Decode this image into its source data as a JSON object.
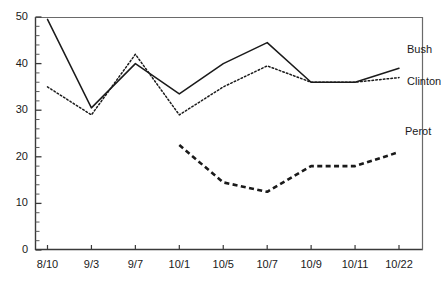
{
  "chart_data": {
    "type": "line",
    "title": "",
    "subtitle": "",
    "xlabel": "",
    "ylabel": "",
    "categories": [
      "8/10",
      "9/3",
      "9/7",
      "10/1",
      "10/5",
      "10/7",
      "10/9",
      "10/11",
      "10/22"
    ],
    "ylim": [
      0,
      50
    ],
    "yticks": [
      0,
      10,
      20,
      30,
      40,
      50
    ],
    "ytick_labels": [
      "0",
      "10",
      "20",
      "30",
      "40",
      "50"
    ],
    "y_minor_tick_step": 2,
    "grid": false,
    "legend_position": "inline-right",
    "series": [
      {
        "name": "Bush",
        "style": "solid",
        "color": "#1a1a1a",
        "values": [
          49.5,
          30.5,
          40,
          33.5,
          40,
          44.5,
          36,
          36,
          39
        ]
      },
      {
        "name": "Clinton",
        "style": "dotted",
        "color": "#1a1a1a",
        "values": [
          35,
          29,
          42,
          29,
          35,
          39.5,
          36,
          36,
          37
        ]
      },
      {
        "name": "Perot",
        "style": "dashed",
        "color": "#1a1a1a",
        "values": [
          null,
          null,
          null,
          22.5,
          14.5,
          12.5,
          18,
          18,
          21
        ]
      }
    ],
    "annotations": [
      {
        "text": "Bush",
        "series": "Bush"
      },
      {
        "text": "Clinton",
        "series": "Clinton"
      },
      {
        "text": "Perot",
        "series": "Perot"
      }
    ]
  }
}
